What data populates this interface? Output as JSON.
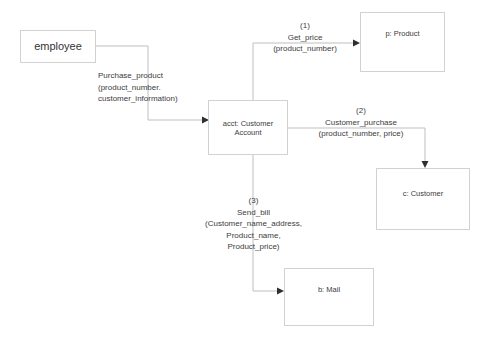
{
  "diagram": {
    "type": "uml-collaboration-diagram",
    "background_color": "#ffffff",
    "box_border_color": "#d2d2d2",
    "connector_color": "#bfbfbf",
    "arrowhead_color": "#2f2f2f",
    "text_color": "#3c3c3c"
  },
  "objects": [
    {
      "id": "employee",
      "name": "employee",
      "label": "employee"
    },
    {
      "id": "account",
      "name": "acct: Customer Account",
      "label": "acct: Customer\nAccount"
    },
    {
      "id": "product",
      "name": "p: Product",
      "label": "p: Product"
    },
    {
      "id": "customer",
      "name": "c: Customer",
      "label": "c: Customer"
    },
    {
      "id": "mail",
      "name": "b: Mail",
      "label": "b: Mail"
    }
  ],
  "messages": [
    {
      "id": "purchase_product",
      "sequence": "",
      "operation": "Purchase_product",
      "parameters": "(product_number.\ncustomer_information)",
      "label": "Purchase_product\n(product_number.\ncustomer_information)",
      "from": "employee",
      "to": "account"
    },
    {
      "id": "get_price",
      "sequence": "(1)",
      "operation": "Get_price",
      "parameters": "(product_number)",
      "label": "(1)\nGet_price\n(product_number)",
      "from": "account",
      "to": "product"
    },
    {
      "id": "customer_purchase",
      "sequence": "(2)",
      "operation": "Customer_purchase",
      "parameters": "(product_number, price)",
      "label": "(2)\nCustomer_purchase\n(product_number, price)",
      "from": "account",
      "to": "customer"
    },
    {
      "id": "send_bill",
      "sequence": "(3)",
      "operation": "Send_bill",
      "parameters": "(Customer_name_address,\nProduct_name,\nProduct_price)",
      "label": "(3)\nSend_bill\n(Customer_name_address,\nProduct_name,\nProduct_price)",
      "from": "account",
      "to": "mail"
    }
  ]
}
